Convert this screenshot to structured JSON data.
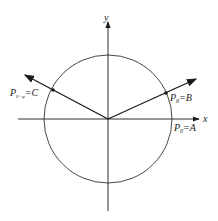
{
  "diagram": {
    "axes": {
      "x_label": "x",
      "y_label": "y"
    },
    "points": {
      "A": {
        "label_main": "P",
        "label_sub": "0",
        "label_rest": "=A"
      },
      "B": {
        "label_main": "P",
        "label_sub": "θ",
        "label_rest": "=B"
      },
      "C": {
        "label_main": "P",
        "label_sub": "θ+φ",
        "label_rest": "=C"
      }
    },
    "colors": {
      "stroke": "#1a1a1a",
      "circle": "#333333"
    }
  }
}
